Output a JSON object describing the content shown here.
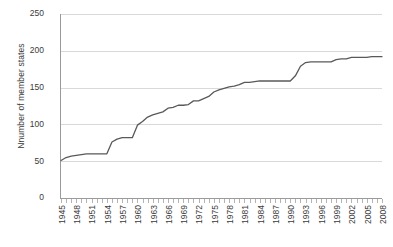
{
  "chart_data": {
    "type": "line",
    "title": "",
    "xlabel": "",
    "ylabel": "Nnumber of member states",
    "ylim": [
      0,
      250
    ],
    "xlim": [
      1945,
      2008
    ],
    "ytick_labels": [
      "250",
      "200",
      "150",
      "100",
      "50",
      "0"
    ],
    "ytick_values": [
      250,
      200,
      150,
      100,
      50,
      0
    ],
    "ytick_step": 50,
    "grid": "horizontal",
    "legend": "none",
    "series_color": "#595959",
    "gridline_color": "#d9d9d9",
    "axis_color": "#9a9a9a",
    "text_color": "#3b3b3b",
    "xtick_label_rotation": -90,
    "xtick_label_interval": 3,
    "xtick_labels": [
      "1945",
      "1948",
      "1951",
      "1954",
      "1957",
      "1960",
      "1963",
      "1966",
      "1969",
      "1972",
      "1975",
      "1978",
      "1981",
      "1984",
      "1987",
      "1990",
      "1993",
      "1996",
      "1999",
      "2002",
      "2005",
      "2008"
    ],
    "x": [
      1945,
      1946,
      1947,
      1948,
      1949,
      1950,
      1951,
      1952,
      1953,
      1954,
      1955,
      1956,
      1957,
      1958,
      1959,
      1960,
      1961,
      1962,
      1963,
      1964,
      1965,
      1966,
      1967,
      1968,
      1969,
      1970,
      1971,
      1972,
      1973,
      1974,
      1975,
      1976,
      1977,
      1978,
      1979,
      1980,
      1981,
      1982,
      1983,
      1984,
      1985,
      1986,
      1987,
      1988,
      1989,
      1990,
      1991,
      1992,
      1993,
      1994,
      1995,
      1996,
      1997,
      1998,
      1999,
      2000,
      2001,
      2002,
      2003,
      2004,
      2005,
      2006,
      2007,
      2008
    ],
    "values": [
      51,
      55,
      57,
      58,
      59,
      60,
      60,
      60,
      60,
      60,
      76,
      80,
      82,
      82,
      82,
      99,
      104,
      110,
      113,
      115,
      117,
      122,
      123,
      126,
      126,
      127,
      132,
      132,
      135,
      138,
      144,
      147,
      149,
      151,
      152,
      154,
      157,
      157,
      158,
      159,
      159,
      159,
      159,
      159,
      159,
      159,
      166,
      179,
      184,
      185,
      185,
      185,
      185,
      185,
      188,
      189,
      189,
      191,
      191,
      191,
      191,
      192,
      192,
      192
    ]
  }
}
